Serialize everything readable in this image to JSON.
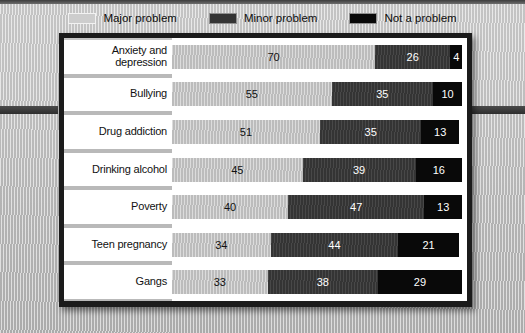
{
  "legend": {
    "items": [
      {
        "label": "Major problem",
        "key": "major",
        "color": "#cdcdcd"
      },
      {
        "label": "Minor problem",
        "key": "minor",
        "color": "#343434"
      },
      {
        "label": "Not a problem",
        "key": "none",
        "color": "#0a0a0a"
      }
    ]
  },
  "chart_data": {
    "type": "bar",
    "orientation": "horizontal",
    "stacked": true,
    "title": "",
    "xlabel": "",
    "ylabel": "",
    "xlim": [
      0,
      100
    ],
    "grid": false,
    "legend_position": "top-center",
    "categories": [
      "Anxiety and depression",
      "Bullying",
      "Drug addiction",
      "Drinking alcohol",
      "Poverty",
      "Teen pregnancy",
      "Gangs"
    ],
    "series": [
      {
        "name": "Major problem",
        "color": "#c4c4c4",
        "values": [
          70,
          55,
          51,
          45,
          40,
          34,
          33
        ]
      },
      {
        "name": "Minor problem",
        "color": "#3a3a3a",
        "values": [
          26,
          35,
          35,
          39,
          47,
          44,
          38
        ]
      },
      {
        "name": "Not a problem",
        "color": "#090909",
        "values": [
          4,
          10,
          13,
          16,
          13,
          21,
          29
        ]
      }
    ]
  },
  "rows": [
    {
      "label_line1": "Anxiety and",
      "label_line2": "depression",
      "major": 70,
      "minor": 26,
      "none": 4
    },
    {
      "label_line1": "Bullying",
      "label_line2": "",
      "major": 55,
      "minor": 35,
      "none": 10
    },
    {
      "label_line1": "Drug addiction",
      "label_line2": "",
      "major": 51,
      "minor": 35,
      "none": 13
    },
    {
      "label_line1": "Drinking alcohol",
      "label_line2": "",
      "major": 45,
      "minor": 39,
      "none": 16
    },
    {
      "label_line1": "Poverty",
      "label_line2": "",
      "major": 40,
      "minor": 47,
      "none": 13
    },
    {
      "label_line1": "Teen pregnancy",
      "label_line2": "",
      "major": 34,
      "minor": 44,
      "none": 21
    },
    {
      "label_line1": "Gangs",
      "label_line2": "",
      "major": 33,
      "minor": 38,
      "none": 29
    }
  ]
}
